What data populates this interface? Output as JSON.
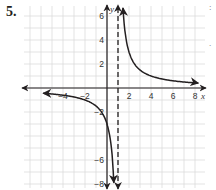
{
  "problem": {
    "number": "5."
  },
  "edge_marks": [
    ":",
    "."
  ],
  "chart_data": {
    "type": "line",
    "title": "",
    "function": "y = 3/(x - 1)",
    "xlabel": "x",
    "ylabel": "y",
    "xlim": [
      -5.5,
      8.5
    ],
    "ylim": [
      -8.5,
      6.5
    ],
    "grid": true,
    "x_ticks": [
      -4,
      -2,
      2,
      4,
      6,
      8
    ],
    "x_tick_labels": [
      "−4",
      "−2",
      "2",
      "4",
      "6",
      "8"
    ],
    "y_ticks": [
      6,
      4,
      2,
      -2,
      -6,
      -8
    ],
    "y_tick_labels": [
      "6",
      "4",
      "2",
      "−2",
      "−6",
      "−8"
    ],
    "vertical_asymptote": {
      "x": 1,
      "style": "dashed"
    },
    "horizontal_asymptote": {
      "y": 0
    },
    "series": [
      {
        "name": "right-branch",
        "x": [
          1.5,
          2,
          3,
          4,
          5,
          6,
          8
        ],
        "y": [
          6,
          3,
          1.5,
          1,
          0.75,
          0.6,
          0.43
        ]
      },
      {
        "name": "left-branch",
        "x": [
          -5,
          -4,
          -2,
          -1,
          0,
          0.5,
          0.6
        ],
        "y": [
          -0.5,
          -0.6,
          -1,
          -1.5,
          -3,
          -6,
          -7.5
        ]
      }
    ]
  },
  "colors": {
    "grid": "#dcdcdc",
    "axis": "#231f20",
    "curve": "#231f20"
  }
}
